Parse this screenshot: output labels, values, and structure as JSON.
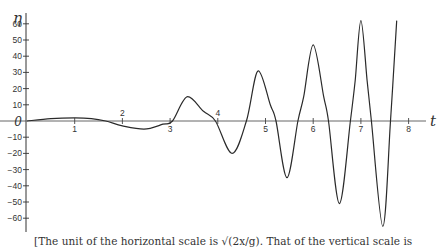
{
  "chart_data": {
    "type": "line",
    "title": "",
    "xlabel": "t",
    "ylabel": "η",
    "xlim": [
      0,
      8.3
    ],
    "ylim": [
      -68,
      68
    ],
    "grid": false,
    "x_ticks": [
      1,
      2,
      3,
      4,
      5,
      6,
      7,
      8
    ],
    "x_tick_labels": [
      "1",
      "2",
      "3",
      "4",
      "5",
      "6",
      "7",
      "8"
    ],
    "y_ticks": [
      60,
      50,
      40,
      30,
      20,
      10,
      0,
      -10,
      -20,
      -30,
      -40,
      -50,
      -60
    ],
    "y_tick_labels": [
      "60",
      "50",
      "40",
      "30",
      "20",
      "10",
      "0",
      "−10",
      "−20",
      "−30",
      "−40",
      "−50",
      "−60"
    ],
    "series": [
      {
        "name": "η(t)",
        "x": [
          0,
          0.5,
          1.0,
          1.35,
          1.65,
          2.0,
          2.45,
          2.85,
          3.05,
          3.37,
          3.7,
          3.95,
          4.3,
          4.6,
          4.85,
          5.1,
          5.22,
          5.45,
          5.68,
          5.8,
          6.0,
          6.22,
          6.32,
          6.55,
          6.78,
          6.88,
          7.0,
          7.13,
          7.22,
          7.46,
          7.62,
          7.75
        ],
        "y": [
          0,
          1.5,
          2.0,
          1.5,
          0,
          -3,
          -5,
          -2,
          0,
          15,
          6,
          0,
          -20,
          0,
          31,
          10,
          0,
          -35,
          0,
          15,
          47,
          15,
          0,
          -51,
          0,
          25,
          62,
          25,
          0,
          -65,
          0,
          62
        ]
      }
    ],
    "annotations": []
  },
  "caption": {
    "line1": "[The unit of the horizontal scale is √(2x/g).  That of the vertical scale is",
    "line2": "l(y π)1/4."
  }
}
